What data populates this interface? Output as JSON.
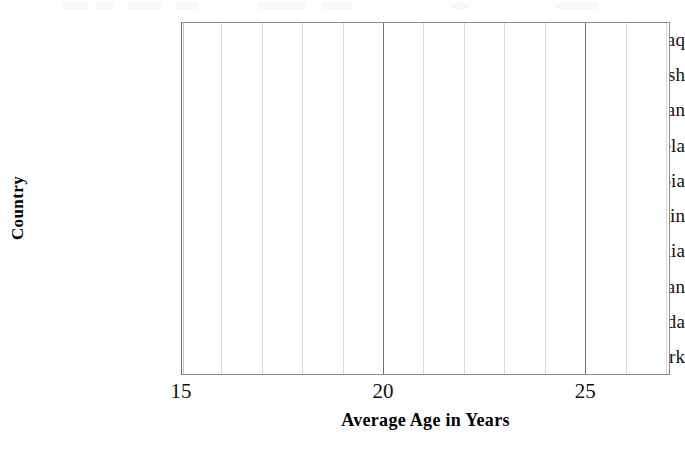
{
  "figure": {
    "kind": "empty-horizontal-bar-chart-grid"
  },
  "chart_data": {
    "type": "bar",
    "orientation": "horizontal",
    "title": "",
    "xlabel": "Average Age in Years",
    "ylabel": "Country",
    "categories": [
      "Iraq",
      "Bangladesh",
      "Sudan",
      "Venezuela",
      "Ethiopia",
      "Spain",
      "Australia",
      "Japan",
      "Canada",
      "Denmark"
    ],
    "values": [
      null,
      null,
      null,
      null,
      null,
      null,
      null,
      null,
      null,
      null
    ],
    "xlim": [
      15,
      27.1
    ],
    "ylim": [
      0,
      10
    ],
    "xticks": [
      15,
      20,
      25
    ],
    "xtick_labels": [
      "15",
      "20",
      "25"
    ],
    "gridline_values": [
      15,
      16,
      17,
      18,
      19,
      20,
      21,
      22,
      23,
      24,
      25,
      26,
      27
    ],
    "major_gridline_values": [
      15,
      20,
      25
    ],
    "grid": "vertical-only",
    "legend": "none",
    "note": "Blank plotting grid: axes and gridlines drawn, no bars plotted."
  },
  "axes": {
    "y": {
      "title": "Country",
      "tick_labels": [
        "Iraq",
        "Bangladesh",
        "Sudan",
        "Venezuela",
        "Ethiopia",
        "Spain",
        "Australia",
        "Japan",
        "Canada",
        "Denmark"
      ]
    },
    "x": {
      "title": "Average Age in Years",
      "tick_labels": [
        "15",
        "20",
        "25"
      ]
    }
  },
  "style": {
    "background": "#ffffff",
    "frame_color": "#8d8d8d",
    "gridline_color": "#d8d8d8",
    "major_gridline_color": "#6f6f6f",
    "text_color": "#111111"
  }
}
